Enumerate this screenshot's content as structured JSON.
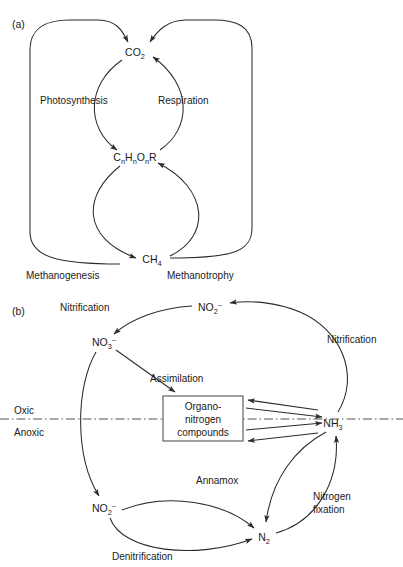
{
  "figure": {
    "background_color": "#ffffff",
    "line_color": "#2b2b2b",
    "text_color": "#1a1a1a",
    "panels": [
      {
        "id": "a",
        "label": "(a)",
        "title": "Carbon cycle",
        "nodes": [
          {
            "id": "co2",
            "label": "CO",
            "sub": "2",
            "sup": "",
            "x": 135,
            "y": 52
          },
          {
            "id": "chor",
            "label": "C",
            "sub": "n",
            "label2": "H",
            "sub2": "n",
            "label3": "O",
            "sub3": "n",
            "label4": "R",
            "x": 135,
            "y": 157
          },
          {
            "id": "ch4",
            "label": "CH",
            "sub": "4",
            "sup": "",
            "x": 152,
            "y": 259
          }
        ],
        "processes": [
          {
            "id": "photosynthesis",
            "label": "Photosynthesis",
            "x": 40,
            "y": 104,
            "from": "co2",
            "to": "chor"
          },
          {
            "id": "respiration",
            "label": "Respiration",
            "x": 158,
            "y": 104,
            "from": "chor",
            "to": "co2"
          },
          {
            "id": "methanogenesis",
            "label": "Methanogenesis",
            "x": 26,
            "y": 276,
            "from": "chor",
            "to": "ch4"
          },
          {
            "id": "methanotrophy",
            "label": "Methanotrophy",
            "x": 167,
            "y": 276,
            "from": "ch4",
            "to": "chor"
          }
        ]
      },
      {
        "id": "b",
        "label": "(b)",
        "title": "Nitrogen cycle",
        "zones": [
          {
            "id": "oxic",
            "label": "Oxic",
            "x": 14,
            "y": 411
          },
          {
            "id": "anoxic",
            "label": "Anoxic",
            "x": 14,
            "y": 432
          }
        ],
        "redox_boundary_y": 419,
        "nodes": [
          {
            "id": "no2_top",
            "label": "NO",
            "sub": "2",
            "sup": "–",
            "x": 210,
            "y": 307
          },
          {
            "id": "no3",
            "label": "NO",
            "sub": "3",
            "sup": "–",
            "x": 104,
            "y": 342
          },
          {
            "id": "no2_bottom",
            "label": "NO",
            "sub": "2",
            "sup": "–",
            "x": 104,
            "y": 508
          },
          {
            "id": "n2",
            "label": "N",
            "sub": "2",
            "sup": "",
            "x": 264,
            "y": 537
          },
          {
            "id": "nh3",
            "label": "NH",
            "sub": "3",
            "sup": "",
            "x": 333,
            "y": 423
          }
        ],
        "box": {
          "id": "organo-nitrogen",
          "lines": [
            "Organo-",
            "nitrogen",
            "compounds"
          ],
          "x": 163,
          "y": 396,
          "width": 80,
          "height": 45
        },
        "processes": [
          {
            "id": "nitrification-left",
            "label": "Nitrification",
            "x": 60,
            "y": 308,
            "from": "no2_top",
            "to": "no3"
          },
          {
            "id": "nitrification-right",
            "label": "Nitrification",
            "x": 327,
            "y": 340,
            "from": "nh3",
            "to": "no2_top"
          },
          {
            "id": "assimilation",
            "label": "Assimilation",
            "x": 150,
            "y": 379,
            "from": "no3",
            "to": "organo-nitrogen"
          },
          {
            "id": "annamox",
            "label": "Annamox",
            "x": 196,
            "y": 481,
            "from": "nh3",
            "to": "n2"
          },
          {
            "id": "nitrogen-fixation",
            "label": "Nitrogen fixation",
            "line1": "Nitrogen",
            "line2": "fixation",
            "x": 313,
            "y": 497,
            "from": "n2",
            "to": "nh3"
          },
          {
            "id": "denitrification",
            "label": "Denitrification",
            "x": 112,
            "y": 557,
            "from": "no2_bottom",
            "to": "n2"
          }
        ]
      }
    ]
  }
}
